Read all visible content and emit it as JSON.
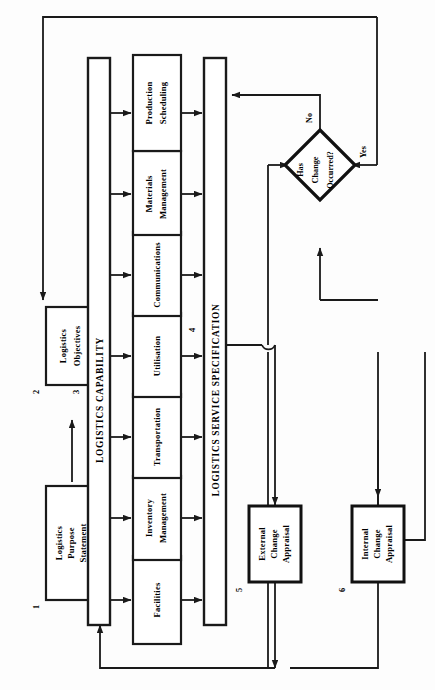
{
  "diagram": {
    "orientation": "rotated-90",
    "nodes": {
      "purpose_statement": {
        "number": "1",
        "line1": "Logistics",
        "line2": "Purpose",
        "line3": "Statement"
      },
      "objectives": {
        "number": "2",
        "line1": "Logistics",
        "line2": "Objectives"
      },
      "capability_bar": {
        "number": "3",
        "label": "LOGISTICS CAPABILITY"
      },
      "specification_bar": {
        "number": "4",
        "label": "LOGISTICS SERVICE SPECIFICATION"
      },
      "external_appraisal": {
        "number": "5",
        "line1": "External",
        "line2": "Change",
        "line3": "Appraisal"
      },
      "internal_appraisal": {
        "number": "6",
        "line1": "Internal",
        "line2": "Change",
        "line3": "Appraisal"
      },
      "decision": {
        "line1": "Has",
        "line2": "Change",
        "line3": "Occurred?",
        "yes_label": "Yes",
        "no_label": "No"
      }
    },
    "capability_items": [
      {
        "id": "facilities",
        "line1": "Facilities",
        "line2": ""
      },
      {
        "id": "inventory-management",
        "line1": "Inventory",
        "line2": "Management"
      },
      {
        "id": "transportation",
        "line1": "Transportation",
        "line2": ""
      },
      {
        "id": "utilisation",
        "line1": "Utilisation",
        "line2": ""
      },
      {
        "id": "communications",
        "line1": "Communications",
        "line2": ""
      },
      {
        "id": "materials-management",
        "line1": "Materials",
        "line2": "Management"
      },
      {
        "id": "production-scheduling",
        "line1": "Production",
        "line2": "Scheduling"
      }
    ],
    "colors": {
      "ink": "#1a1a1a",
      "paper": "#fdfdfd",
      "box_fill": "#ffffff"
    }
  }
}
